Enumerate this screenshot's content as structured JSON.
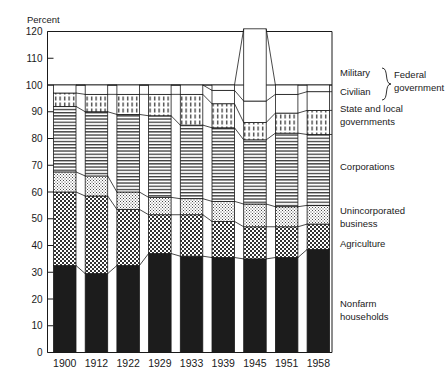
{
  "chart_data": {
    "type": "bar",
    "subtype": "stacked-percentage-column",
    "title": "",
    "xlabel": "",
    "ylabel": "Percent",
    "ylim": [
      0,
      120
    ],
    "ytick_step": 10,
    "yticks": [
      0,
      10,
      20,
      30,
      40,
      50,
      60,
      70,
      80,
      90,
      100,
      110,
      120
    ],
    "grid": false,
    "legend_position": "right",
    "categories": [
      "1900",
      "1912",
      "1922",
      "1929",
      "1933",
      "1939",
      "1945",
      "1951",
      "1958"
    ],
    "series": [
      {
        "name": "Nonfarm households",
        "pattern": "solid-black",
        "values": [
          32.5,
          29.5,
          32.5,
          37.0,
          36.0,
          35.5,
          35.0,
          35.5,
          38.5
        ]
      },
      {
        "name": "Agriculture",
        "pattern": "checker",
        "values": [
          27.5,
          29.0,
          21.0,
          14.5,
          15.5,
          13.5,
          12.0,
          11.5,
          9.5
        ]
      },
      {
        "name": "Unincorporated business",
        "pattern": "fine-dot",
        "values": [
          7.5,
          7.5,
          6.5,
          6.5,
          6.0,
          7.5,
          8.5,
          7.5,
          7.0
        ]
      },
      {
        "name": "Corporations",
        "pattern": "horizontal-lines",
        "values": [
          24.5,
          24.0,
          29.0,
          30.5,
          27.5,
          27.5,
          24.0,
          27.5,
          26.5
        ]
      },
      {
        "name": "State and local governments",
        "pattern": "vertical-dashes",
        "values": [
          5.0,
          6.5,
          7.5,
          8.0,
          11.5,
          9.0,
          6.5,
          7.5,
          9.0
        ]
      },
      {
        "name": "Civilian",
        "pattern": "white",
        "values": [
          3.0,
          3.5,
          3.5,
          3.5,
          3.5,
          5.0,
          8.0,
          7.0,
          7.0
        ]
      },
      {
        "name": "Military",
        "pattern": "white",
        "values": [
          0.0,
          0.0,
          0.0,
          0.0,
          0.0,
          2.0,
          27.0,
          3.5,
          2.5
        ]
      }
    ],
    "group_labels": [
      {
        "label": "Federal government",
        "members": [
          "Military",
          "Civilian"
        ]
      }
    ],
    "legend_entries": [
      {
        "label": "Military",
        "pattern": "white"
      },
      {
        "label": "Civilian",
        "pattern": "white"
      },
      {
        "label": "Federal government",
        "pattern": "brace-group"
      },
      {
        "label": "State and local governments",
        "pattern": "vertical-dashes"
      },
      {
        "label": "Corporations",
        "pattern": "horizontal-lines"
      },
      {
        "label": "Unincorporated business",
        "pattern": "fine-dot"
      },
      {
        "label": "Agriculture",
        "pattern": "checker"
      },
      {
        "label": "Nonfarm households",
        "pattern": "solid-black"
      }
    ],
    "colors": {
      "ink": "#1a1a1a",
      "background": "#ffffff",
      "solid_black": "#1c1c1c"
    }
  },
  "legend_text": {
    "military": "Military",
    "civilian": "Civilian",
    "federal_line1": "Federal",
    "federal_line2": "government",
    "state_line1": "State and local",
    "state_line2": "governments",
    "corporations": "Corporations",
    "unincorporated_line1": "Unincorporated",
    "unincorporated_line2": "business",
    "agriculture": "Agriculture",
    "nonfarm_line1": "Nonfarm",
    "nonfarm_line2": "households"
  },
  "axis": {
    "y_title": "Percent",
    "ytick_labels": [
      "120",
      "110",
      "100",
      "90",
      "80",
      "70",
      "60",
      "50",
      "40",
      "30",
      "20",
      "10",
      "0"
    ],
    "xtick_labels": [
      "1900",
      "1912",
      "1922",
      "1929",
      "1933",
      "1939",
      "1945",
      "1951",
      "1958"
    ]
  }
}
